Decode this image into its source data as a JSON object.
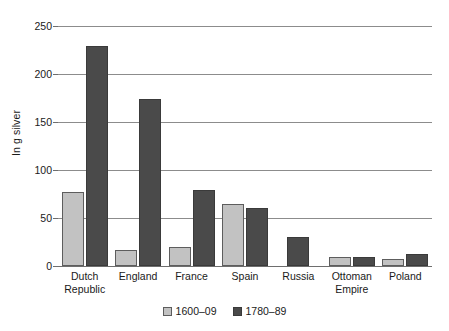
{
  "chart_data": {
    "type": "bar",
    "title": "",
    "xlabel": "",
    "ylabel": "In g silver",
    "ylim": [
      0,
      250
    ],
    "yticks": [
      0,
      50,
      100,
      150,
      200,
      250
    ],
    "ytick_labels": [
      "0",
      "50",
      "100",
      "150",
      "200",
      "250"
    ],
    "grid": true,
    "legend_position": "bottom",
    "categories": [
      "Dutch Republic",
      "England",
      "France",
      "Spain",
      "Russia",
      "Ottoman Empire",
      "Poland"
    ],
    "category_lines": [
      [
        "Dutch",
        "Republic"
      ],
      [
        "England",
        ""
      ],
      [
        "France",
        ""
      ],
      [
        "Spain",
        ""
      ],
      [
        "Russia",
        ""
      ],
      [
        "Ottoman",
        "Empire"
      ],
      [
        "Poland",
        ""
      ]
    ],
    "series": [
      {
        "name": "1600–09",
        "color": "#c2c2c2",
        "values": [
          77,
          17,
          20,
          65,
          0,
          9,
          7
        ]
      },
      {
        "name": "1780–89",
        "color": "#4a4a4a",
        "values": [
          229,
          174,
          79,
          60,
          30,
          9,
          13
        ]
      }
    ]
  }
}
